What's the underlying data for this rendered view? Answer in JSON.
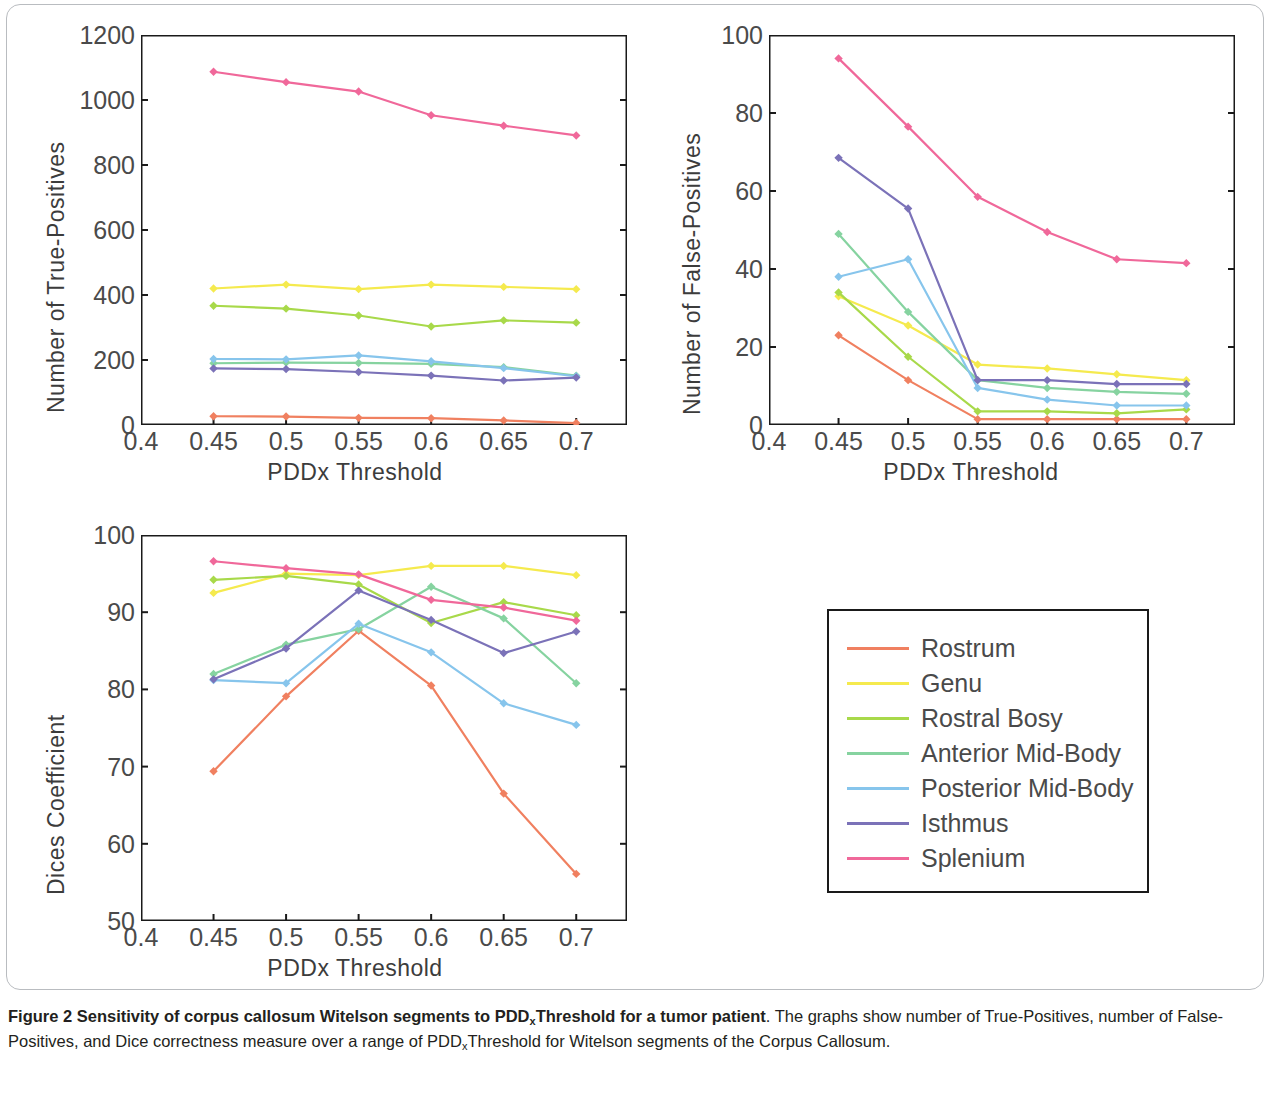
{
  "figure": {
    "caption_bold": "Figure 2 Sensitivity of corpus callosum Witelson segments to PDDxThreshold for a tumor patient",
    "caption_bold_pre": "Figure 2 Sensitivity of corpus callosum Witelson segments to PDD",
    "caption_bold_sub": "x",
    "caption_bold_post": "Threshold for a tumor patient",
    "caption_rest_1": ". The graphs show number of True-Positives, number of False-Positives, and Dice correctness measure over a range of PDD",
    "caption_rest_sub": "x",
    "caption_rest_2": "Threshold for Witelson segments of the Corpus Callosum."
  },
  "legend": {
    "position": "bottom-right",
    "items": [
      {
        "label": "Rostrum",
        "color": "#f08060"
      },
      {
        "label": "Genu",
        "color": "#f5ea4e"
      },
      {
        "label": "Rostral Bosy",
        "color": "#a8d94a"
      },
      {
        "label": "Anterior Mid-Body",
        "color": "#86d3a0"
      },
      {
        "label": "Posterior Mid-Body",
        "color": "#87c5ec"
      },
      {
        "label": "Isthmus",
        "color": "#7b72b8"
      },
      {
        "label": "Splenium",
        "color": "#f0689a"
      }
    ]
  },
  "chart_data": [
    {
      "id": "true-positives",
      "type": "line",
      "title": "",
      "xlabel": "PDDx Threshold",
      "ylabel": "Number of True-Positives",
      "x": [
        0.45,
        0.5,
        0.55,
        0.6,
        0.65,
        0.7
      ],
      "xticks": [
        0.4,
        0.45,
        0.5,
        0.55,
        0.6,
        0.65,
        0.7
      ],
      "xticklabels": [
        "0.4",
        "0.45",
        "0.5",
        "0.55",
        "0.6",
        "0.65",
        "0.7"
      ],
      "yticks": [
        0,
        200,
        400,
        600,
        800,
        1000,
        1200
      ],
      "yticklabels": [
        "0",
        "200",
        "400",
        "600",
        "800",
        "1000",
        "1200"
      ],
      "xlim": [
        0.4,
        0.735
      ],
      "ylim": [
        0,
        1200
      ],
      "grid": false,
      "series": [
        {
          "name": "Rostrum",
          "color": "#f08060",
          "values": [
            27,
            26,
            22,
            21,
            14,
            6
          ]
        },
        {
          "name": "Genu",
          "color": "#f5ea4e",
          "values": [
            420,
            432,
            418,
            432,
            425,
            418
          ]
        },
        {
          "name": "Rostral Bosy",
          "color": "#a8d94a",
          "values": [
            367,
            358,
            337,
            303,
            322,
            315
          ]
        },
        {
          "name": "Anterior Mid-Body",
          "color": "#86d3a0",
          "values": [
            190,
            192,
            191,
            188,
            178,
            152
          ]
        },
        {
          "name": "Posterior Mid-Body",
          "color": "#87c5ec",
          "values": [
            203,
            202,
            214,
            196,
            175,
            150
          ]
        },
        {
          "name": "Isthmus",
          "color": "#7b72b8",
          "values": [
            174,
            172,
            163,
            152,
            137,
            146
          ]
        },
        {
          "name": "Splenium",
          "color": "#f0689a",
          "values": [
            1087,
            1055,
            1026,
            953,
            921,
            891
          ]
        }
      ]
    },
    {
      "id": "false-positives",
      "type": "line",
      "title": "",
      "xlabel": "PDDx Threshold",
      "ylabel": "Number of False-Positives",
      "x": [
        0.45,
        0.5,
        0.55,
        0.6,
        0.65,
        0.7
      ],
      "xticks": [
        0.4,
        0.45,
        0.5,
        0.55,
        0.6,
        0.65,
        0.7
      ],
      "xticklabels": [
        "0.4",
        "0.45",
        "0.5",
        "0.55",
        "0.6",
        "0.65",
        "0.7"
      ],
      "yticks": [
        0,
        20,
        40,
        60,
        80,
        100
      ],
      "yticklabels": [
        "0",
        "20",
        "40",
        "60",
        "80",
        "100"
      ],
      "xlim": [
        0.4,
        0.735
      ],
      "ylim": [
        0,
        100
      ],
      "grid": false,
      "series": [
        {
          "name": "Rostrum",
          "color": "#f08060",
          "values": [
            23,
            11.5,
            1.5,
            1.5,
            1.5,
            1.5
          ]
        },
        {
          "name": "Genu",
          "color": "#f5ea4e",
          "values": [
            33,
            25.5,
            15.5,
            14.5,
            13,
            11.5
          ]
        },
        {
          "name": "Rostral Bosy",
          "color": "#a8d94a",
          "values": [
            34,
            17.5,
            3.5,
            3.5,
            3,
            4
          ]
        },
        {
          "name": "Anterior Mid-Body",
          "color": "#86d3a0",
          "values": [
            49,
            29,
            11.5,
            9.5,
            8.5,
            8
          ]
        },
        {
          "name": "Posterior Mid-Body",
          "color": "#87c5ec",
          "values": [
            38,
            42.5,
            9.5,
            6.5,
            5,
            5
          ]
        },
        {
          "name": "Isthmus",
          "color": "#7b72b8",
          "values": [
            68.5,
            55.5,
            11.5,
            11.5,
            10.5,
            10.5
          ]
        },
        {
          "name": "Splenium",
          "color": "#f0689a",
          "values": [
            94,
            76.5,
            58.5,
            49.5,
            42.5,
            41.5
          ]
        }
      ]
    },
    {
      "id": "dices-coefficient",
      "type": "line",
      "title": "",
      "xlabel": "PDDx Threshold",
      "ylabel": "Dices Coefficient",
      "x": [
        0.45,
        0.5,
        0.55,
        0.6,
        0.65,
        0.7
      ],
      "xticks": [
        0.4,
        0.45,
        0.5,
        0.55,
        0.6,
        0.65,
        0.7
      ],
      "xticklabels": [
        "0.4",
        "0.45",
        "0.5",
        "0.55",
        "0.6",
        "0.65",
        "0.7"
      ],
      "yticks": [
        50,
        60,
        70,
        80,
        90,
        100
      ],
      "yticklabels": [
        "50",
        "60",
        "70",
        "80",
        "90",
        "100"
      ],
      "xlim": [
        0.4,
        0.735
      ],
      "ylim": [
        50,
        100
      ],
      "grid": false,
      "series": [
        {
          "name": "Rostrum",
          "color": "#f08060",
          "values": [
            69.4,
            79.1,
            87.6,
            80.5,
            66.5,
            56.1
          ]
        },
        {
          "name": "Genu",
          "color": "#f5ea4e",
          "values": [
            92.5,
            95.0,
            94.8,
            96.0,
            96.0,
            94.8
          ]
        },
        {
          "name": "Rostral Bosy",
          "color": "#a8d94a",
          "values": [
            94.2,
            94.7,
            93.6,
            88.6,
            91.3,
            89.6
          ]
        },
        {
          "name": "Anterior Mid-Body",
          "color": "#86d3a0",
          "values": [
            82.0,
            85.8,
            87.8,
            93.3,
            89.2,
            80.8
          ]
        },
        {
          "name": "Posterior Mid-Body",
          "color": "#87c5ec",
          "values": [
            81.2,
            80.8,
            88.5,
            84.8,
            78.2,
            75.4
          ]
        },
        {
          "name": "Isthmus",
          "color": "#7b72b8",
          "values": [
            81.3,
            85.3,
            92.8,
            89.0,
            84.7,
            87.5
          ]
        },
        {
          "name": "Splenium",
          "color": "#f0689a",
          "values": [
            96.6,
            95.7,
            94.9,
            91.6,
            90.6,
            88.9
          ]
        }
      ]
    }
  ]
}
